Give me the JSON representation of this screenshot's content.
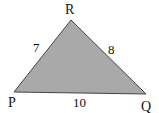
{
  "diagram": {
    "type": "triangle",
    "fill_color": "#a9a9a9",
    "stroke_color": "#444444",
    "vertices": [
      {
        "name": "R",
        "x": 71,
        "y": 20
      },
      {
        "name": "P",
        "x": 14,
        "y": 92
      },
      {
        "name": "Q",
        "x": 146,
        "y": 94
      }
    ],
    "sides": [
      {
        "between": "PR",
        "length": "7"
      },
      {
        "between": "RQ",
        "length": "8"
      },
      {
        "between": "PQ",
        "length": "10"
      }
    ]
  },
  "labels": {
    "R": "R",
    "P": "P",
    "Q": "Q",
    "side_PR": "7",
    "side_RQ": "8",
    "side_PQ": "10"
  }
}
